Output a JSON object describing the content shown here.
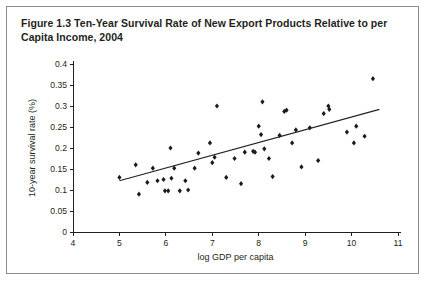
{
  "figure": {
    "number": "Figure 1.3",
    "title": "Ten-Year Survival Rate of New Export Products Relative to per Capita Income, 2004",
    "title_line1": "Figure 1.3  Ten-Year Survival Rate of New Export Products Relative to per Capita",
    "title_line2": "Income, 2004"
  },
  "colors": {
    "ink": "#231f20",
    "point": "#1a1a1a",
    "frame": "#8b8b8b",
    "background": "#ffffff"
  },
  "chart_data": {
    "type": "scatter",
    "title": "Figure 1.3  Ten-Year Survival Rate of New Export Products Relative to per Capita Income, 2004",
    "xlabel": "log GDP per capita",
    "ylabel": "10-year survival rate (%)",
    "xlim": [
      4,
      11
    ],
    "ylim": [
      0,
      0.4
    ],
    "xticks": [
      4,
      5,
      6,
      7,
      8,
      9,
      10,
      11
    ],
    "xtick_labels": [
      "4",
      "5",
      "6",
      "7",
      "8",
      "9",
      "10",
      "11"
    ],
    "yticks": [
      0,
      0.05,
      0.1,
      0.15,
      0.2,
      0.25,
      0.3,
      0.35,
      0.4
    ],
    "ytick_labels": [
      "0",
      "0.05",
      "0.1",
      "0.15",
      "0.2",
      "0.25",
      "0.3",
      "0.35",
      "0.4"
    ],
    "grid": false,
    "legend": "none",
    "marker": "diamond",
    "points": [
      [
        5.0,
        0.13
      ],
      [
        5.35,
        0.16
      ],
      [
        5.42,
        0.09
      ],
      [
        5.6,
        0.118
      ],
      [
        5.72,
        0.152
      ],
      [
        5.82,
        0.122
      ],
      [
        5.95,
        0.125
      ],
      [
        5.98,
        0.098
      ],
      [
        6.05,
        0.098
      ],
      [
        6.1,
        0.2
      ],
      [
        6.12,
        0.128
      ],
      [
        6.18,
        0.152
      ],
      [
        6.3,
        0.098
      ],
      [
        6.42,
        0.122
      ],
      [
        6.48,
        0.1
      ],
      [
        6.62,
        0.152
      ],
      [
        6.7,
        0.188
      ],
      [
        6.95,
        0.212
      ],
      [
        7.0,
        0.165
      ],
      [
        7.05,
        0.178
      ],
      [
        7.1,
        0.3
      ],
      [
        7.3,
        0.13
      ],
      [
        7.48,
        0.175
      ],
      [
        7.62,
        0.115
      ],
      [
        7.7,
        0.19
      ],
      [
        7.88,
        0.192
      ],
      [
        7.92,
        0.19
      ],
      [
        8.0,
        0.252
      ],
      [
        8.05,
        0.232
      ],
      [
        8.08,
        0.31
      ],
      [
        8.12,
        0.198
      ],
      [
        8.22,
        0.175
      ],
      [
        8.3,
        0.132
      ],
      [
        8.45,
        0.23
      ],
      [
        8.55,
        0.287
      ],
      [
        8.6,
        0.29
      ],
      [
        8.72,
        0.212
      ],
      [
        8.8,
        0.243
      ],
      [
        8.92,
        0.155
      ],
      [
        9.1,
        0.248
      ],
      [
        9.28,
        0.17
      ],
      [
        9.4,
        0.282
      ],
      [
        9.5,
        0.3
      ],
      [
        9.52,
        0.292
      ],
      [
        9.9,
        0.238
      ],
      [
        10.05,
        0.212
      ],
      [
        10.1,
        0.252
      ],
      [
        10.28,
        0.228
      ],
      [
        10.46,
        0.365
      ]
    ],
    "trendline": {
      "x": [
        5.0,
        10.6
      ],
      "y": [
        0.122,
        0.292
      ],
      "slope": 0.0304,
      "intercept": -0.03
    }
  }
}
